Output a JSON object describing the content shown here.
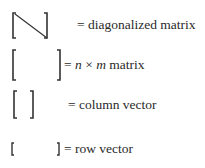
{
  "legend": [
    {
      "symbol": "diagonalized-matrix-bracket",
      "equals": "=",
      "label": "diagonalized matrix"
    },
    {
      "symbol": "matrix-bracket",
      "equals": "=",
      "label_parts": {
        "n": "n",
        "times": "×",
        "m": "m",
        "rest": "matrix"
      }
    },
    {
      "symbol": "column-vector-bracket",
      "equals": "=",
      "label": "column vector"
    },
    {
      "symbol": "row-vector-bracket",
      "equals": "=",
      "label": "row vector"
    }
  ]
}
